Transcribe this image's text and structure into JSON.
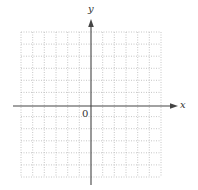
{
  "diagram": {
    "type": "coordinate-plane",
    "x_axis_label": "x",
    "y_axis_label": "y",
    "origin_label": "0",
    "grid": {
      "columns": 12,
      "rows": 12,
      "style": "dotted",
      "color": "#b8b8b8"
    },
    "axis_color": "#444444"
  }
}
